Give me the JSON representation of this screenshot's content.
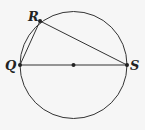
{
  "diagram": {
    "circle": {
      "cx": 73.5,
      "cy": 65,
      "r": 53.5
    },
    "points": {
      "Q": {
        "label": "Q",
        "x": 20,
        "y": 65
      },
      "R": {
        "label": "R",
        "x": 40,
        "y": 21
      },
      "S": {
        "label": "S",
        "x": 127,
        "y": 65
      },
      "center": {
        "x": 73.5,
        "y": 65
      }
    },
    "segments": [
      "QR",
      "RS",
      "QS"
    ],
    "colors": {
      "stroke": "#333333",
      "background": "#f6f6f6"
    }
  }
}
